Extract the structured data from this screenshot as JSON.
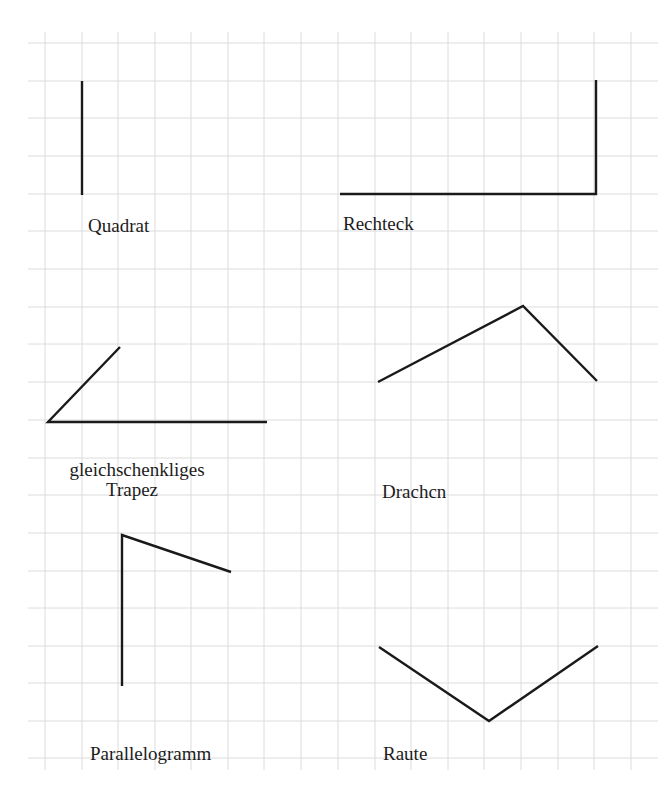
{
  "grid": {
    "color": "#dcdcdc",
    "x_lines": [
      45,
      82,
      118,
      155,
      191,
      228,
      264,
      301,
      338,
      375,
      411,
      448,
      484,
      521,
      558,
      594,
      631
    ],
    "y_lines": [
      43,
      81,
      118,
      156,
      194,
      231,
      269,
      307,
      344,
      382,
      420,
      458,
      495,
      533,
      571,
      608,
      646,
      683,
      721,
      758
    ],
    "extent": {
      "x0": 28,
      "x1": 658,
      "y0": 32,
      "y1": 770
    }
  },
  "stroke_color": "#1a1a1a",
  "figures": [
    {
      "name": "Quadrat",
      "points": [
        [
          82,
          81
        ],
        [
          82,
          195
        ]
      ],
      "label": {
        "lines": [
          "Quadrat"
        ],
        "x": 88,
        "y": 216
      }
    },
    {
      "name": "Rechteck",
      "points": [
        [
          340,
          194
        ],
        [
          596,
          194
        ],
        [
          596,
          80
        ]
      ],
      "label": {
        "lines": [
          "Rechteck"
        ],
        "x": 343,
        "y": 214
      }
    },
    {
      "name": "gleichschenkliges Trapez",
      "points": [
        [
          120,
          347
        ],
        [
          48,
          422
        ],
        [
          267,
          422
        ]
      ],
      "label": {
        "lines": [
          "gleichschenkliges",
          "Trapez"
        ],
        "x": 52,
        "y": 460
      }
    },
    {
      "name": "Drachen",
      "points": [
        [
          378,
          382
        ],
        [
          523,
          306
        ],
        [
          597,
          381
        ]
      ],
      "label": {
        "lines": [
          "Drachcn"
        ],
        "x": 382,
        "y": 482
      }
    },
    {
      "name": "Parallelogramm",
      "points": [
        [
          122,
          686
        ],
        [
          122,
          535
        ],
        [
          231,
          572
        ]
      ],
      "label": {
        "lines": [
          "Parallelogramm"
        ],
        "x": 90,
        "y": 744
      }
    },
    {
      "name": "Raute",
      "points": [
        [
          379,
          647
        ],
        [
          489,
          721
        ],
        [
          598,
          646
        ]
      ],
      "label": {
        "lines": [
          "Raute"
        ],
        "x": 383,
        "y": 744
      }
    }
  ],
  "labels": {
    "quadrat": "Quadrat",
    "rechteck": "Rechteck",
    "trapez_line1": "gleichschenkliges",
    "trapez_line2": "Trapez",
    "drachen": "Drachcn",
    "parallelogramm": "Parallelogramm",
    "raute": "Raute"
  }
}
